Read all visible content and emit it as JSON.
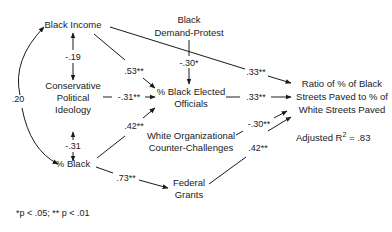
{
  "nodes": {
    "black_income": "Black Income",
    "conservative_1": "Conservative",
    "conservative_2": "Political",
    "conservative_3": "Ideology",
    "pct_black": "% Black",
    "demand_1": "Black",
    "demand_2": "Demand-Protest",
    "officials_1": "% Black Elected",
    "officials_2": "Officials",
    "white_org_1": "White Organizational",
    "white_org_2": "Counter-Challenges",
    "federal_1": "Federal",
    "federal_2": "Grants",
    "outcome_1": "Ratio of % of Black",
    "outcome_2": "Streets Paved to % of",
    "outcome_3": "White Streets Paved"
  },
  "edges": {
    "income_ideology": "-.19",
    "income_pctblack": ".20",
    "ideology_pctblack": "-.31",
    "income_officials": ".53**",
    "ideology_officials": "-.31**",
    "pctblack_officials": ".42**",
    "protest_officials": "-.30*",
    "income_outcome": ".33**",
    "officials_outcome": ".33**",
    "whiteorg_outcome": "-.30**",
    "federal_outcome": ".42**",
    "pctblack_federal": ".73**"
  },
  "fit": {
    "label": "Adjusted R",
    "sup": "2",
    "value": " = .83"
  },
  "footnote": "*p < .05; ** p < .01"
}
